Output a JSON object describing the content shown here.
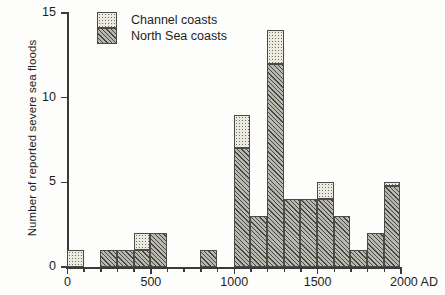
{
  "chart_data": {
    "type": "bar",
    "title": "",
    "subtitle": "",
    "xlabel": "",
    "ylabel": "Number of reported severe sea floods",
    "x_unit_suffix": "AD",
    "xlim": [
      0,
      2000
    ],
    "ylim": [
      0,
      15
    ],
    "bin_width": 100,
    "grid": false,
    "stacked": true,
    "legend_position": "top-left",
    "xticks": [
      0,
      500,
      1000,
      1500,
      2000
    ],
    "xtick_labels": [
      "0",
      "500",
      "1000",
      "1500",
      "2000 AD"
    ],
    "yticks": [
      0,
      5,
      10,
      15
    ],
    "ytick_labels": [
      "0",
      "5",
      "10",
      "15"
    ],
    "categories": [
      "0-100",
      "100-200",
      "200-300",
      "300-400",
      "400-500",
      "500-600",
      "600-700",
      "700-800",
      "800-900",
      "900-1000",
      "1000-1100",
      "1100-1200",
      "1200-1300",
      "1300-1400",
      "1400-1500",
      "1500-1600",
      "1600-1700",
      "1700-1800",
      "1800-1900",
      "1900-2000"
    ],
    "bin_starts": [
      0,
      100,
      200,
      300,
      400,
      500,
      600,
      700,
      800,
      900,
      1000,
      1100,
      1200,
      1300,
      1400,
      1500,
      1600,
      1700,
      1800,
      1900
    ],
    "series": [
      {
        "name": "North Sea coasts",
        "pattern": "diagonal-hatch",
        "color": "#b9b8b0",
        "values": [
          0,
          0,
          1,
          1,
          1,
          2,
          0,
          0,
          1,
          0,
          7,
          3,
          12,
          4,
          4,
          4,
          3,
          1,
          2,
          4.8
        ]
      },
      {
        "name": "Channel coasts",
        "pattern": "dotted",
        "color": "#eceadf",
        "values": [
          1,
          0,
          0,
          0,
          1,
          0,
          0,
          0,
          0,
          0,
          2,
          0,
          2,
          0,
          0,
          1,
          0,
          0,
          0,
          0.2
        ]
      }
    ],
    "totals": [
      1,
      0,
      1,
      1,
      2,
      2,
      0,
      0,
      1,
      0,
      9,
      3,
      14,
      4,
      4,
      5,
      3,
      1,
      2,
      5
    ]
  },
  "legend": {
    "items": [
      {
        "label": "Channel coasts",
        "swatch": "dotted-swatch"
      },
      {
        "label": "North Sea coasts",
        "swatch": "hatch-swatch"
      }
    ]
  }
}
